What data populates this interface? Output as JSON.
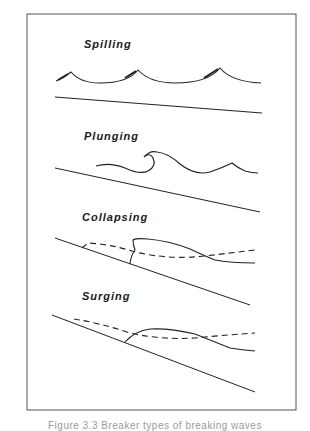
{
  "figure": {
    "panels": [
      {
        "id": "spilling",
        "label": "Spilling"
      },
      {
        "id": "plunging",
        "label": "Plunging"
      },
      {
        "id": "collapsing",
        "label": "Collapsing"
      },
      {
        "id": "surging",
        "label": "Surging"
      }
    ],
    "caption": "Figure 3.3   Breaker types of breaking waves"
  },
  "colors": {
    "line": "#222222",
    "frame": "#555555",
    "background": "#ffffff"
  }
}
